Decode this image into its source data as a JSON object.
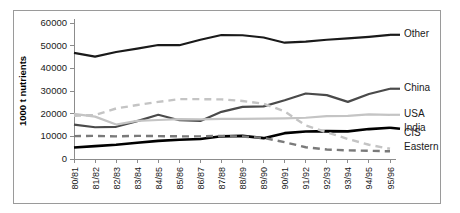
{
  "chart_data": {
    "type": "line",
    "title": "",
    "xlabel": "",
    "ylabel": "1000 t nutrients",
    "ylim": [
      0,
      60000
    ],
    "ytick_values": [
      0,
      10000,
      20000,
      30000,
      40000,
      50000,
      60000
    ],
    "ytick_labels": [
      "0",
      "10000",
      "20000",
      "30000",
      "40000",
      "50000",
      "60000"
    ],
    "grid": false,
    "legend_position": "right-of-plot-at-line-ends",
    "categories": [
      "80/81",
      "81/82",
      "82/83",
      "83/84",
      "84/85",
      "85/86",
      "86/87",
      "87/88",
      "88/89",
      "89/90",
      "90/91",
      "91/92",
      "92/93",
      "93/94",
      "94/95",
      "95/96"
    ],
    "series": [
      {
        "name": "Other",
        "color": "#1a1a1a",
        "style": "solid",
        "width": 2.2,
        "values": [
          46800,
          45200,
          47200,
          48700,
          50300,
          50200,
          52600,
          54700,
          54600,
          53600,
          51300,
          51800,
          52600,
          53200,
          53900,
          54800
        ]
      },
      {
        "name": "China",
        "color": "#4a4a4a",
        "style": "solid",
        "width": 2.2,
        "values": [
          15200,
          14000,
          14200,
          16700,
          19500,
          17100,
          16800,
          20800,
          23000,
          23200,
          25900,
          28900,
          28200,
          25200,
          28700,
          31000
        ]
      },
      {
        "name": "USA",
        "color": "#c4c4c4",
        "style": "solid",
        "width": 2.2,
        "values": [
          19900,
          18700,
          15200,
          16800,
          17200,
          17600,
          17500,
          17700,
          17700,
          17800,
          17900,
          18200,
          18900,
          19000,
          19700,
          19500
        ]
      },
      {
        "name": "India",
        "color": "#000000",
        "style": "solid",
        "width": 2.6,
        "values": [
          5100,
          5700,
          6300,
          7200,
          8000,
          8500,
          8800,
          10000,
          10200,
          9200,
          11400,
          12100,
          12300,
          12200,
          13200,
          13800
        ]
      },
      {
        "name": "CIS",
        "color": "#c4c4c4",
        "style": "dashed",
        "width": 2.4,
        "values": [
          19100,
          19400,
          22300,
          23800,
          25200,
          26400,
          26400,
          26300,
          25600,
          24400,
          21000,
          14800,
          11800,
          8800,
          6300,
          4500
        ]
      },
      {
        "name": "Eastern Europe",
        "color": "#7a7a7a",
        "style": "dashed",
        "width": 2.4,
        "values": [
          10100,
          10200,
          10000,
          10200,
          10100,
          10000,
          10000,
          10200,
          9900,
          9300,
          7400,
          5200,
          4200,
          3800,
          3600,
          3400
        ]
      }
    ],
    "legend_entries": [
      {
        "label": "Other",
        "value_at_end": 54800
      },
      {
        "label": "China",
        "value_at_end": 31000
      },
      {
        "label": "USA",
        "value_at_end": 19500
      },
      {
        "label": "India",
        "value_at_end": 13800
      },
      {
        "label": "CIS",
        "value_at_end": 4500
      },
      {
        "label": "Eastern Europe",
        "value_at_end": 3400
      }
    ]
  }
}
